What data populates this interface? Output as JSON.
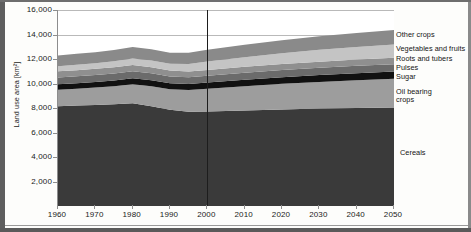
{
  "axes": {
    "y_title": "Land use area [km²]",
    "y_ticks": [
      "16,000",
      "14,000",
      "12,000",
      "10,000",
      "8,000",
      "6,000",
      "4,000",
      "2,000"
    ],
    "x_ticks": [
      "1960",
      "1970",
      "1980",
      "1990",
      "2000",
      "2010",
      "2020",
      "2030",
      "2040",
      "2050"
    ]
  },
  "legend": {
    "other_crops": "Other crops",
    "vegetables_fruits": "Vegetables and fruits",
    "roots_tubers": "Roots and tubers",
    "pulses": "Pulses",
    "sugar": "Sugar",
    "oil_bearing_line1": "Oil bearing",
    "oil_bearing_line2": "crops",
    "cereals": "Cereals"
  },
  "colors": {
    "cereals": "#3a3a3a",
    "oil_bearing": "#9d9d9d",
    "sugar": "#111111",
    "pulses": "#6b6b6b",
    "roots_tubers": "#8f8f8f",
    "vegetables_fruits": "#c4c4c4",
    "other_crops": "#8a8a8a",
    "gridline": "#b9b9b9",
    "divider": "#1d1d1d",
    "axis": "#8d8d8d"
  },
  "chart_data": {
    "type": "area",
    "title": "",
    "xlabel": "",
    "ylabel": "Land use area [km²]",
    "xlim": [
      1960,
      2050
    ],
    "ylim": [
      0,
      16000
    ],
    "grid": true,
    "stacked": true,
    "legend_position": "right-direct-labels",
    "annotations": [
      {
        "type": "vline",
        "x": 2000,
        "label": "historical / projection divider"
      }
    ],
    "x": [
      1960,
      1965,
      1970,
      1975,
      1980,
      1985,
      1990,
      1995,
      2000,
      2010,
      2020,
      2030,
      2040,
      2050
    ],
    "series": [
      {
        "name": "Cereals",
        "values": [
          8150,
          8200,
          8250,
          8300,
          8380,
          8150,
          7850,
          7700,
          7720,
          7800,
          7880,
          7950,
          8000,
          8050
        ]
      },
      {
        "name": "Oil bearing crops",
        "values": [
          1350,
          1380,
          1420,
          1480,
          1560,
          1620,
          1680,
          1760,
          1850,
          1980,
          2090,
          2180,
          2260,
          2330
        ]
      },
      {
        "name": "Sugar",
        "values": [
          440,
          450,
          460,
          470,
          490,
          490,
          490,
          500,
          510,
          530,
          550,
          565,
          580,
          590
        ]
      },
      {
        "name": "Pulses",
        "values": [
          560,
          565,
          570,
          575,
          580,
          570,
          560,
          555,
          560,
          570,
          580,
          590,
          600,
          610
        ]
      },
      {
        "name": "Roots and tubers",
        "values": [
          490,
          495,
          500,
          505,
          510,
          500,
          480,
          470,
          470,
          480,
          490,
          500,
          510,
          520
        ]
      },
      {
        "name": "Vegetables and fruits",
        "values": [
          420,
          440,
          460,
          490,
          520,
          540,
          560,
          610,
          680,
          790,
          880,
          960,
          1030,
          1090
        ]
      },
      {
        "name": "Other crops",
        "values": [
          880,
          890,
          900,
          920,
          940,
          920,
          900,
          920,
          960,
          1020,
          1070,
          1110,
          1150,
          1180
        ]
      }
    ]
  }
}
